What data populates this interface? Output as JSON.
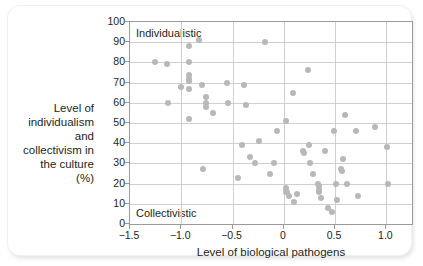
{
  "figure": {
    "y_axis_title": "Level of individualism and collectivism in the culture (%)",
    "x_axis_title": "Level of biological pathogens",
    "top_region_label": "Individualistic",
    "bottom_region_label": "Collectivistic",
    "point_color": "#b6b8ba",
    "axis_color": "#9a9a9a",
    "grid_color": "#cfcfcf",
    "text_color": "#231f20"
  },
  "chart_data": {
    "type": "scatter",
    "title": "",
    "xlabel": "Level of biological pathogens",
    "ylabel": "Level of individualism and collectivism in the culture (%)",
    "xlim": [
      -1.5,
      1.25
    ],
    "ylim": [
      0,
      100
    ],
    "xticks": [
      -1.5,
      -1.0,
      -0.5,
      0,
      0.5,
      1.0
    ],
    "xticklabels": [
      "−1.5",
      "−1.0",
      "−0.5",
      "0",
      "0.5",
      "1.0"
    ],
    "yticks": [
      0,
      10,
      20,
      30,
      40,
      50,
      60,
      70,
      80,
      90,
      100
    ],
    "yticklabels": [
      "0",
      "10",
      "20",
      "30",
      "40",
      "50",
      "60",
      "70",
      "80",
      "90",
      "100"
    ],
    "grid": true,
    "legend": null,
    "annotations": [
      {
        "text": "Individualistic",
        "position": "top-left-inside"
      },
      {
        "text": "Collectivistic",
        "position": "bottom-left-inside"
      }
    ],
    "series": [
      {
        "name": "countries",
        "marker": "circle",
        "color": "#b6b8ba",
        "points": [
          [
            -1.26,
            80
          ],
          [
            -1.14,
            79
          ],
          [
            -1.13,
            60
          ],
          [
            -1.0,
            68
          ],
          [
            -0.92,
            88
          ],
          [
            -0.92,
            80
          ],
          [
            -0.92,
            74
          ],
          [
            -0.92,
            72
          ],
          [
            -0.92,
            71
          ],
          [
            -0.92,
            67
          ],
          [
            -0.92,
            52
          ],
          [
            -0.83,
            91
          ],
          [
            -0.8,
            69
          ],
          [
            -0.79,
            27
          ],
          [
            -0.76,
            63
          ],
          [
            -0.76,
            60
          ],
          [
            -0.76,
            58
          ],
          [
            -0.69,
            55
          ],
          [
            -0.55,
            70
          ],
          [
            -0.54,
            60
          ],
          [
            -0.45,
            23
          ],
          [
            -0.41,
            39
          ],
          [
            -0.39,
            69
          ],
          [
            -0.37,
            59
          ],
          [
            -0.33,
            33
          ],
          [
            -0.28,
            30
          ],
          [
            -0.24,
            41
          ],
          [
            -0.18,
            90
          ],
          [
            -0.13,
            25
          ],
          [
            -0.1,
            30
          ],
          [
            -0.07,
            46
          ],
          [
            0.02,
            51
          ],
          [
            0.02,
            18
          ],
          [
            0.02,
            16
          ],
          [
            0.03,
            16
          ],
          [
            0.05,
            14
          ],
          [
            0.09,
            65
          ],
          [
            0.1,
            11
          ],
          [
            0.13,
            15
          ],
          [
            0.19,
            36
          ],
          [
            0.2,
            35
          ],
          [
            0.24,
            76
          ],
          [
            0.25,
            39
          ],
          [
            0.26,
            30
          ],
          [
            0.28,
            25
          ],
          [
            0.33,
            20
          ],
          [
            0.34,
            19
          ],
          [
            0.34,
            17
          ],
          [
            0.34,
            16
          ],
          [
            0.36,
            13
          ],
          [
            0.4,
            36
          ],
          [
            0.43,
            8
          ],
          [
            0.47,
            6
          ],
          [
            0.49,
            46
          ],
          [
            0.51,
            20
          ],
          [
            0.52,
            12
          ],
          [
            0.56,
            27
          ],
          [
            0.57,
            26
          ],
          [
            0.58,
            32
          ],
          [
            0.6,
            54
          ],
          [
            0.62,
            20
          ],
          [
            0.7,
            46
          ],
          [
            0.72,
            14
          ],
          [
            0.89,
            48
          ],
          [
            1.01,
            38
          ],
          [
            1.02,
            20
          ]
        ]
      }
    ]
  }
}
